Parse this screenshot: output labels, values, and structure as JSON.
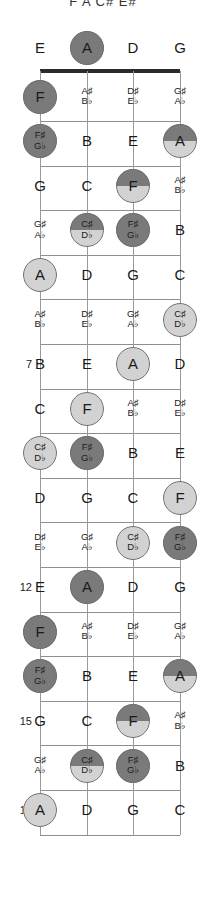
{
  "title": "F  A  C#  E#",
  "diagram": {
    "type": "guitar-fretboard",
    "instrument_strings": [
      "E",
      "A",
      "D",
      "G"
    ],
    "string_count": 4,
    "fret_start": 0,
    "fret_end": 17,
    "marked_fret_numbers": [
      5,
      7,
      9,
      12,
      15,
      17
    ],
    "colors": {
      "highlight_dark": "#7a7a7a",
      "highlight_light": "#d2d2d2",
      "line": "#8e8e8e",
      "nut": "#2b2b2b",
      "text": "#1a1a1a"
    },
    "legend": {
      "dark_meaning": "root / chord tone",
      "light_meaning": "scale tone"
    }
  },
  "frets": [
    {
      "num": 0,
      "label": "",
      "notes": [
        {
          "nat": "E",
          "enh": null,
          "hl": null
        },
        {
          "nat": "A",
          "enh": null,
          "hl": "dark"
        },
        {
          "nat": "D",
          "enh": null,
          "hl": null
        },
        {
          "nat": "G",
          "enh": null,
          "hl": null
        }
      ]
    },
    {
      "num": 1,
      "label": "",
      "notes": [
        {
          "nat": "F",
          "enh": null,
          "hl": "dark"
        },
        {
          "nat": null,
          "enh": [
            "A♯",
            "B♭"
          ],
          "hl": null
        },
        {
          "nat": null,
          "enh": [
            "D♯",
            "E♭"
          ],
          "hl": null
        },
        {
          "nat": null,
          "enh": [
            "G♯",
            "A♭"
          ],
          "hl": null
        }
      ]
    },
    {
      "num": 2,
      "label": "",
      "notes": [
        {
          "nat": null,
          "enh": [
            "F♯",
            "G♭"
          ],
          "hl": "dark"
        },
        {
          "nat": "B",
          "enh": null,
          "hl": null
        },
        {
          "nat": "E",
          "enh": null,
          "hl": null
        },
        {
          "nat": "A",
          "enh": null,
          "hl": "split"
        }
      ]
    },
    {
      "num": 3,
      "label": "",
      "notes": [
        {
          "nat": "G",
          "enh": null,
          "hl": null
        },
        {
          "nat": "C",
          "enh": null,
          "hl": null
        },
        {
          "nat": "F",
          "enh": null,
          "hl": "split"
        },
        {
          "nat": null,
          "enh": [
            "A♯",
            "B♭"
          ],
          "hl": null
        }
      ]
    },
    {
      "num": 4,
      "label": "",
      "notes": [
        {
          "nat": null,
          "enh": [
            "G♯",
            "A♭"
          ],
          "hl": null
        },
        {
          "nat": null,
          "enh": [
            "C♯",
            "D♭"
          ],
          "hl": "split"
        },
        {
          "nat": null,
          "enh": [
            "F♯",
            "G♭"
          ],
          "hl": "dark"
        },
        {
          "nat": "B",
          "enh": null,
          "hl": null
        }
      ]
    },
    {
      "num": 5,
      "label": "5",
      "notes": [
        {
          "nat": "A",
          "enh": null,
          "hl": "light"
        },
        {
          "nat": "D",
          "enh": null,
          "hl": null
        },
        {
          "nat": "G",
          "enh": null,
          "hl": null
        },
        {
          "nat": "C",
          "enh": null,
          "hl": null
        }
      ]
    },
    {
      "num": 6,
      "label": "",
      "notes": [
        {
          "nat": null,
          "enh": [
            "A♯",
            "B♭"
          ],
          "hl": null
        },
        {
          "nat": null,
          "enh": [
            "D♯",
            "E♭"
          ],
          "hl": null
        },
        {
          "nat": null,
          "enh": [
            "G♯",
            "A♭"
          ],
          "hl": null
        },
        {
          "nat": null,
          "enh": [
            "C♯",
            "D♭"
          ],
          "hl": "light"
        }
      ]
    },
    {
      "num": 7,
      "label": "7",
      "notes": [
        {
          "nat": "B",
          "enh": null,
          "hl": null
        },
        {
          "nat": "E",
          "enh": null,
          "hl": null
        },
        {
          "nat": "A",
          "enh": null,
          "hl": "light"
        },
        {
          "nat": "D",
          "enh": null,
          "hl": null
        }
      ]
    },
    {
      "num": 8,
      "label": "",
      "notes": [
        {
          "nat": "C",
          "enh": null,
          "hl": null
        },
        {
          "nat": "F",
          "enh": null,
          "hl": "light"
        },
        {
          "nat": null,
          "enh": [
            "A♯",
            "B♭"
          ],
          "hl": null
        },
        {
          "nat": null,
          "enh": [
            "D♯",
            "E♭"
          ],
          "hl": null
        }
      ]
    },
    {
      "num": 9,
      "label": "9",
      "notes": [
        {
          "nat": null,
          "enh": [
            "C♯",
            "D♭"
          ],
          "hl": "light"
        },
        {
          "nat": null,
          "enh": [
            "F♯",
            "G♭"
          ],
          "hl": "dark"
        },
        {
          "nat": "B",
          "enh": null,
          "hl": null
        },
        {
          "nat": "E",
          "enh": null,
          "hl": null
        }
      ]
    },
    {
      "num": 10,
      "label": "",
      "notes": [
        {
          "nat": "D",
          "enh": null,
          "hl": null
        },
        {
          "nat": "G",
          "enh": null,
          "hl": null
        },
        {
          "nat": "C",
          "enh": null,
          "hl": null
        },
        {
          "nat": "F",
          "enh": null,
          "hl": "light"
        }
      ]
    },
    {
      "num": 11,
      "label": "",
      "notes": [
        {
          "nat": null,
          "enh": [
            "D♯",
            "E♭"
          ],
          "hl": null
        },
        {
          "nat": null,
          "enh": [
            "G♯",
            "A♭"
          ],
          "hl": null
        },
        {
          "nat": null,
          "enh": [
            "C♯",
            "D♭"
          ],
          "hl": "light"
        },
        {
          "nat": null,
          "enh": [
            "F♯",
            "G♭"
          ],
          "hl": "dark"
        }
      ]
    },
    {
      "num": 12,
      "label": "12",
      "notes": [
        {
          "nat": "E",
          "enh": null,
          "hl": null
        },
        {
          "nat": "A",
          "enh": null,
          "hl": "dark"
        },
        {
          "nat": "D",
          "enh": null,
          "hl": null
        },
        {
          "nat": "G",
          "enh": null,
          "hl": null
        }
      ]
    },
    {
      "num": 13,
      "label": "",
      "notes": [
        {
          "nat": "F",
          "enh": null,
          "hl": "dark"
        },
        {
          "nat": null,
          "enh": [
            "A♯",
            "B♭"
          ],
          "hl": null
        },
        {
          "nat": null,
          "enh": [
            "D♯",
            "E♭"
          ],
          "hl": null
        },
        {
          "nat": null,
          "enh": [
            "G♯",
            "A♭"
          ],
          "hl": null
        }
      ]
    },
    {
      "num": 14,
      "label": "",
      "notes": [
        {
          "nat": null,
          "enh": [
            "F♯",
            "G♭"
          ],
          "hl": "dark"
        },
        {
          "nat": "B",
          "enh": null,
          "hl": null
        },
        {
          "nat": "E",
          "enh": null,
          "hl": null
        },
        {
          "nat": "A",
          "enh": null,
          "hl": "split"
        }
      ]
    },
    {
      "num": 15,
      "label": "15",
      "notes": [
        {
          "nat": "G",
          "enh": null,
          "hl": null
        },
        {
          "nat": "C",
          "enh": null,
          "hl": null
        },
        {
          "nat": "F",
          "enh": null,
          "hl": "split"
        },
        {
          "nat": null,
          "enh": [
            "A♯",
            "B♭"
          ],
          "hl": null
        }
      ]
    },
    {
      "num": 16,
      "label": "",
      "notes": [
        {
          "nat": null,
          "enh": [
            "G♯",
            "A♭"
          ],
          "hl": null
        },
        {
          "nat": null,
          "enh": [
            "C♯",
            "D♭"
          ],
          "hl": "split"
        },
        {
          "nat": null,
          "enh": [
            "F♯",
            "G♭"
          ],
          "hl": "dark"
        },
        {
          "nat": "B",
          "enh": null,
          "hl": null
        }
      ]
    },
    {
      "num": 17,
      "label": "17",
      "notes": [
        {
          "nat": "A",
          "enh": null,
          "hl": "light"
        },
        {
          "nat": "D",
          "enh": null,
          "hl": null
        },
        {
          "nat": "G",
          "enh": null,
          "hl": null
        },
        {
          "nat": "C",
          "enh": null,
          "hl": null
        }
      ]
    }
  ]
}
